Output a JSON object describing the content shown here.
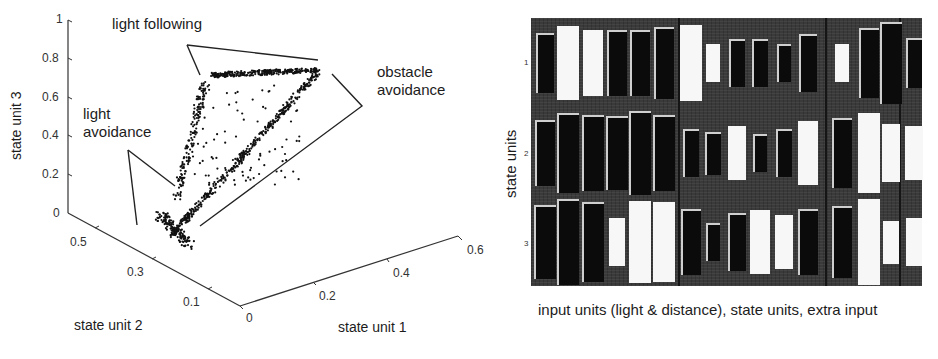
{
  "left_figure": {
    "axes": {
      "z_label": "state unit 3",
      "y_label": "state unit 2",
      "x_label": "state unit 1",
      "z_ticks": [
        "0",
        "0.2",
        "0.4",
        "0.6",
        "0.8",
        "1"
      ],
      "y_ticks": [
        "0.5",
        "0.3",
        "0.1"
      ],
      "x_ticks": [
        "0",
        "0.2",
        "0.4",
        "0.6"
      ]
    },
    "annotations": {
      "light_following": "light following",
      "obstacle_avoidance_1": "obstacle",
      "obstacle_avoidance_2": "avoidance",
      "light_avoidance_1": "light",
      "light_avoidance_2": "avoidance"
    }
  },
  "right_figure": {
    "y_label": "state units",
    "row_ticks": [
      "1",
      "2",
      "3"
    ],
    "caption": "input units (light & distance), state units, extra input"
  },
  "chart_data": [
    {
      "type": "scatter",
      "title": "",
      "xlabel": "state unit 1",
      "ylabel": "state unit 2",
      "zlabel": "state unit 3",
      "xlim": [
        0,
        0.6
      ],
      "ylim": [
        0.1,
        0.5
      ],
      "zlim": [
        0,
        1
      ],
      "x_ticks": [
        0,
        0.2,
        0.4,
        0.6
      ],
      "y_ticks": [
        0.5,
        0.3,
        0.1
      ],
      "z_ticks": [
        0,
        0.2,
        0.4,
        0.6,
        0.8,
        1
      ],
      "description": "3D scatter of state-unit activations forming a triangular loop; clusters labeled by behaviour",
      "annotations": [
        "light following",
        "obstacle avoidance",
        "light avoidance"
      ]
    },
    {
      "type": "heatmap",
      "subtype": "hinton",
      "ylabel": "state units",
      "xlabel": "input units (light & distance), state units, extra input",
      "rows": [
        "1",
        "2",
        "3"
      ],
      "column_groups": [
        {
          "name": "input units (light & distance)",
          "count": 12
        },
        {
          "name": "state units",
          "count": 3
        },
        {
          "name": "extra input",
          "count": 1
        }
      ],
      "weights": [
        [
          -0.5,
          0.75,
          0.6,
          -0.6,
          -0.6,
          -0.7,
          0.8,
          0.2,
          -0.3,
          -0.3,
          -0.2,
          -0.45,
          0.2,
          -0.65,
          -0.9,
          -0.35
        ],
        [
          -0.6,
          -0.85,
          -0.8,
          -0.75,
          -0.95,
          -0.8,
          -0.3,
          -0.25,
          0.4,
          -0.2,
          -0.3,
          0.55,
          -0.65,
          0.85,
          0.45,
          0.4
        ],
        [
          -0.75,
          -1.0,
          -0.85,
          0.3,
          0.9,
          0.85,
          -0.6,
          -0.2,
          -0.45,
          0.55,
          0.4,
          -0.6,
          -0.7,
          1.0,
          0.25,
          0.3
        ]
      ],
      "legend": "white = positive weight, black = negative weight, area ∝ magnitude"
    }
  ]
}
